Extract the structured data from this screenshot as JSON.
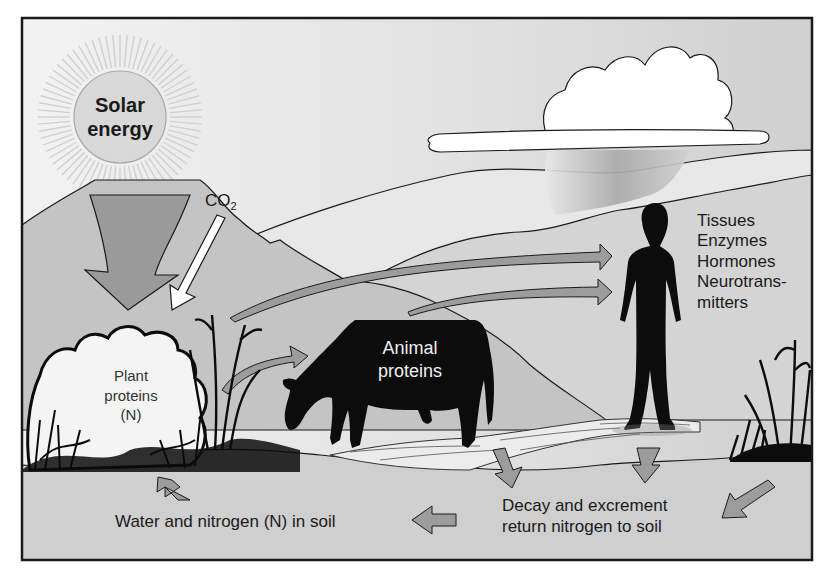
{
  "diagram": {
    "type": "cycle-illustration",
    "nodes": {
      "sun": {
        "label_line1": "Solar",
        "label_line2": "energy"
      },
      "co2": {
        "label_main": "CO",
        "label_sub": "2"
      },
      "plant": {
        "line1": "Plant",
        "line2": "proteins",
        "line3": "(N)"
      },
      "animal": {
        "line1": "Animal",
        "line2": "proteins"
      },
      "human": {
        "items": [
          "Tissues",
          "Enzymes",
          "Hormones",
          "Neurotrans-",
          "mitters"
        ]
      },
      "soil": {
        "label": "Water and nitrogen (N) in soil"
      },
      "decay": {
        "line1": "Decay and excrement",
        "line2": "return nitrogen to soil"
      }
    },
    "edges": [
      {
        "from": "sun",
        "to": "plant",
        "style": "large gray arrow"
      },
      {
        "from": "co2",
        "to": "plant",
        "style": "white outlined arrow"
      },
      {
        "from": "plant",
        "to": "animal",
        "style": "gray curved arrow"
      },
      {
        "from": "plant",
        "to": "human",
        "style": "gray curved arrow"
      },
      {
        "from": "animal",
        "to": "human",
        "style": "gray curved arrow"
      },
      {
        "from": "animal",
        "to": "decay",
        "style": "gray arrow down"
      },
      {
        "from": "human",
        "to": "decay",
        "style": "gray arrow down"
      },
      {
        "from": "right-vegetation",
        "to": "decay",
        "style": "gray arrow down-left"
      },
      {
        "from": "decay",
        "to": "soil",
        "style": "gray arrow left"
      },
      {
        "from": "soil",
        "to": "plant",
        "style": "gray arrow up"
      }
    ],
    "colors": {
      "sky": "#dcdcdc",
      "mountains": "#c4c4c4",
      "arrow_gray": "#9c9c9c",
      "silhouette": "#0c0c0c",
      "soil": "#cfcfcf",
      "frame": "#1a1a1a"
    }
  }
}
